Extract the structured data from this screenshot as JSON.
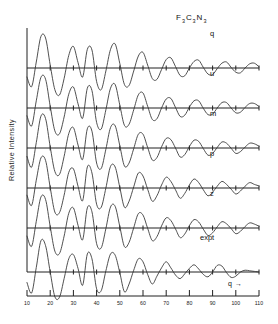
{
  "figure": {
    "title_main": "F",
    "title_parts": [
      {
        "t": "F",
        "sub": "3"
      },
      {
        "t": "C",
        "sub": "3"
      },
      {
        "t": "N",
        "sub": "3"
      }
    ],
    "title_text": "F3C3N3",
    "y_axis_label": "Relative Intensity",
    "x_axis_label": "q",
    "x_axis_arrow": "→",
    "background_color": "#ffffff",
    "curve_color": "#303030",
    "axis_color": "#202020"
  },
  "chart_data": {
    "type": "line",
    "xlabel": "q",
    "ylabel": "Relative Intensity",
    "xlim": [
      10,
      110
    ],
    "grid": false,
    "legend_position": "inline-right",
    "tick_labels": [
      "10",
      "20",
      "30",
      "40",
      "50",
      "60",
      "70",
      "80",
      "90",
      "100",
      "110"
    ],
    "tick_values": [
      10,
      20,
      30,
      40,
      50,
      60,
      70,
      80,
      90,
      100,
      110
    ],
    "panels": [
      {
        "label": "q",
        "x": [
          10,
          12,
          14,
          16,
          18,
          20,
          22,
          24,
          26,
          28,
          30,
          32,
          34,
          36,
          38,
          40,
          42,
          44,
          46,
          48,
          50,
          52,
          54,
          56,
          58,
          60,
          62,
          64,
          66,
          68,
          70,
          72,
          74,
          76,
          78,
          80,
          82,
          84,
          86,
          88,
          90,
          92,
          94,
          96,
          98,
          100,
          102,
          104,
          106,
          108,
          110
        ],
        "values": [
          -0.3,
          -0.62,
          0.2,
          1.05,
          1.0,
          0.1,
          -0.72,
          -0.9,
          -0.35,
          0.42,
          0.72,
          0.18,
          -0.3,
          0.62,
          0.6,
          -0.45,
          -0.72,
          -0.1,
          0.62,
          0.8,
          0.15,
          -0.55,
          -0.58,
          -0.1,
          0.4,
          0.52,
          0.1,
          -0.35,
          -0.38,
          -0.05,
          0.28,
          0.34,
          0.05,
          -0.25,
          -0.26,
          0.0,
          0.22,
          0.26,
          0.02,
          -0.2,
          -0.22,
          -0.02,
          0.16,
          0.2,
          0.02,
          -0.14,
          -0.16,
          0.0,
          0.14,
          0.16,
          0.04
        ]
      },
      {
        "label": "u",
        "x": [
          10,
          12,
          14,
          16,
          18,
          20,
          22,
          24,
          26,
          28,
          30,
          32,
          34,
          36,
          38,
          40,
          42,
          44,
          46,
          48,
          50,
          52,
          54,
          56,
          58,
          60,
          62,
          64,
          66,
          68,
          70,
          72,
          74,
          76,
          78,
          80,
          82,
          84,
          86,
          88,
          90,
          92,
          94,
          96,
          98,
          100,
          102,
          104,
          106,
          108,
          110
        ],
        "values": [
          -0.26,
          -0.6,
          0.24,
          1.02,
          0.96,
          0.06,
          -0.76,
          -0.86,
          -0.3,
          0.46,
          0.7,
          0.14,
          -0.34,
          0.66,
          0.58,
          -0.48,
          -0.7,
          -0.06,
          0.66,
          0.78,
          0.1,
          -0.58,
          -0.54,
          -0.06,
          0.44,
          0.5,
          0.06,
          -0.38,
          -0.36,
          0.0,
          0.3,
          0.32,
          0.02,
          -0.28,
          -0.24,
          0.03,
          0.24,
          0.24,
          -0.01,
          -0.22,
          -0.2,
          0.0,
          0.18,
          0.18,
          0.0,
          -0.16,
          -0.14,
          0.02,
          0.15,
          0.15,
          0.05
        ]
      },
      {
        "label": "m",
        "x": [
          10,
          12,
          14,
          16,
          18,
          20,
          22,
          24,
          26,
          28,
          30,
          32,
          34,
          36,
          38,
          40,
          42,
          44,
          46,
          48,
          50,
          52,
          54,
          56,
          58,
          60,
          62,
          64,
          66,
          68,
          70,
          72,
          74,
          76,
          78,
          80,
          82,
          84,
          86,
          88,
          90,
          92,
          94,
          96,
          98,
          100,
          102,
          104,
          106,
          108,
          110
        ],
        "values": [
          -0.28,
          -0.64,
          0.18,
          1.06,
          0.98,
          0.04,
          -0.78,
          -0.88,
          -0.28,
          0.48,
          0.68,
          0.1,
          -0.38,
          0.64,
          0.56,
          -0.5,
          -0.68,
          -0.04,
          0.68,
          0.74,
          0.08,
          -0.6,
          -0.5,
          -0.02,
          0.46,
          0.46,
          0.02,
          -0.4,
          -0.32,
          0.04,
          0.32,
          0.28,
          0.0,
          -0.3,
          -0.22,
          0.05,
          0.26,
          0.22,
          -0.02,
          -0.24,
          -0.18,
          0.02,
          0.2,
          0.16,
          -0.01,
          -0.18,
          -0.12,
          0.03,
          0.16,
          0.14,
          0.06
        ]
      },
      {
        "label": "p",
        "x": [
          10,
          12,
          14,
          16,
          18,
          20,
          22,
          24,
          26,
          28,
          30,
          32,
          34,
          36,
          38,
          40,
          42,
          44,
          46,
          48,
          50,
          52,
          54,
          56,
          58,
          60,
          62,
          64,
          66,
          68,
          70,
          72,
          74,
          76,
          78,
          80,
          82,
          84,
          86,
          88,
          90,
          92,
          94,
          96,
          98,
          100,
          102,
          104,
          106,
          108,
          110
        ],
        "values": [
          -0.24,
          -0.58,
          0.26,
          1.0,
          0.92,
          0.02,
          -0.8,
          -0.82,
          -0.24,
          0.52,
          0.64,
          0.06,
          -0.42,
          0.7,
          0.5,
          -0.54,
          -0.64,
          0.0,
          0.72,
          0.7,
          0.02,
          -0.64,
          -0.44,
          0.04,
          0.5,
          0.4,
          -0.04,
          -0.44,
          -0.26,
          0.1,
          0.36,
          0.22,
          -0.06,
          -0.34,
          -0.18,
          0.1,
          0.3,
          0.18,
          -0.06,
          -0.26,
          -0.14,
          0.06,
          0.22,
          0.12,
          -0.04,
          -0.2,
          -0.1,
          0.06,
          0.18,
          0.12,
          0.07
        ]
      },
      {
        "label": "z",
        "x": [
          10,
          12,
          14,
          16,
          18,
          20,
          22,
          24,
          26,
          28,
          30,
          32,
          34,
          36,
          38,
          40,
          42,
          44,
          46,
          48,
          50,
          52,
          54,
          56,
          58,
          60,
          62,
          64,
          66,
          68,
          70,
          72,
          74,
          76,
          78,
          80,
          82,
          84,
          86,
          88,
          90,
          92,
          94,
          96,
          98,
          100,
          102,
          104,
          106,
          108,
          110
        ],
        "values": [
          -0.27,
          -0.61,
          0.22,
          1.03,
          0.95,
          0.05,
          -0.77,
          -0.85,
          -0.27,
          0.49,
          0.67,
          0.09,
          -0.39,
          0.67,
          0.54,
          -0.52,
          -0.66,
          -0.02,
          0.7,
          0.72,
          0.05,
          -0.62,
          -0.48,
          0.01,
          0.48,
          0.43,
          -0.01,
          -0.42,
          -0.29,
          0.07,
          0.34,
          0.25,
          -0.03,
          -0.32,
          -0.2,
          0.08,
          0.28,
          0.2,
          -0.04,
          -0.25,
          -0.16,
          0.04,
          0.21,
          0.14,
          -0.02,
          -0.19,
          -0.11,
          0.05,
          0.17,
          0.13,
          0.06
        ]
      },
      {
        "label": "expt",
        "x": [
          10,
          12,
          14,
          16,
          18,
          20,
          22,
          24,
          26,
          28,
          30,
          32,
          34,
          36,
          38,
          40,
          42,
          44,
          46,
          48,
          50,
          52,
          54,
          56,
          58,
          60,
          62,
          64,
          66,
          68,
          70,
          72,
          74,
          76,
          78,
          80,
          82,
          84,
          86,
          88,
          90,
          92,
          94,
          96,
          98,
          100,
          102,
          104,
          106,
          108,
          110
        ],
        "values": [
          -0.35,
          -0.7,
          0.15,
          1.04,
          0.88,
          0.0,
          -0.82,
          -0.84,
          -0.22,
          0.44,
          0.58,
          0.12,
          -0.44,
          0.6,
          0.44,
          -0.56,
          -0.62,
          0.04,
          0.6,
          0.56,
          -0.02,
          -0.66,
          -0.4,
          0.06,
          0.44,
          0.34,
          -0.08,
          -0.4,
          -0.14,
          0.14,
          0.34,
          0.14,
          -0.1,
          -0.22,
          -0.06,
          0.12,
          0.24,
          0.1,
          -0.08,
          -0.16,
          0.0,
          0.22,
          0.2,
          -0.02,
          -0.18,
          -0.14,
          0.0,
          0.06,
          0.04,
          0.02,
          0.0
        ]
      }
    ]
  }
}
